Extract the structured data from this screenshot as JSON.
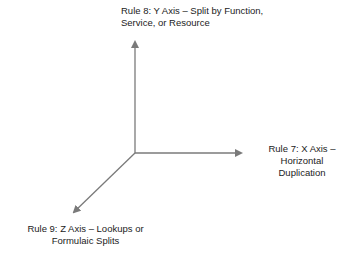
{
  "diagram": {
    "type": "three-axis scale cube",
    "colors": {
      "axis": "#7a7a7a",
      "text": "#222222",
      "background": "#ffffff"
    },
    "origin": {
      "x": 135,
      "y": 153
    },
    "axes": [
      {
        "id": "y",
        "direction": "up",
        "line": "Rule 8: Y Axis – Split by Function,",
        "line2": "Service, or Resource"
      },
      {
        "id": "x",
        "direction": "right",
        "line": "Rule 7: X Axis – Horizontal",
        "line2": "Duplication"
      },
      {
        "id": "z",
        "direction": "down-left",
        "line": "Rule 9: Z Axis – Lookups or",
        "line2": "Formulaic Splits"
      }
    ]
  }
}
